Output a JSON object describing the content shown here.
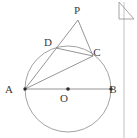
{
  "figure": {
    "background_color": "#ffffff",
    "stroke_color": "#7a7a7a",
    "label_color": "#3c3c3c",
    "points": [
      {
        "id": "P",
        "label": "P",
        "x": 78,
        "y": 20,
        "label_x": 77,
        "label_y": 14,
        "dot": false
      },
      {
        "id": "D",
        "label": "D",
        "x": 56,
        "y": 48,
        "label_x": 48,
        "label_y": 46,
        "dot": false
      },
      {
        "id": "C",
        "label": "C",
        "x": 93,
        "y": 56,
        "label_x": 97,
        "label_y": 56,
        "dot": false
      },
      {
        "id": "A",
        "label": "A",
        "x": 25,
        "y": 89,
        "label_x": 9,
        "label_y": 93,
        "dot": true
      },
      {
        "id": "B",
        "label": "B",
        "x": 111,
        "y": 89,
        "label_x": 113,
        "label_y": 93,
        "dot": true
      },
      {
        "id": "O",
        "label": "O",
        "x": 68,
        "y": 89,
        "label_x": 64,
        "label_y": 102,
        "dot": true
      }
    ],
    "circle": {
      "cx": 68,
      "cy": 89,
      "r": 43
    },
    "segments": [
      {
        "name": "segment-AB",
        "from": "A",
        "to": "B"
      },
      {
        "name": "segment-AD",
        "from": "A",
        "to": "D"
      },
      {
        "name": "segment-AC",
        "from": "A",
        "to": "C"
      },
      {
        "name": "segment-DC",
        "from": "D",
        "to": "C"
      },
      {
        "name": "segment-PD",
        "from": "P",
        "to": "D"
      },
      {
        "name": "segment-PC",
        "from": "P",
        "to": "C"
      },
      {
        "name": "segment-PD-extended",
        "from": "P",
        "to": "A"
      }
    ]
  },
  "page_corner": {
    "icon": "page-fold-icon",
    "x": 119,
    "y": 2,
    "width": 15,
    "height": 17
  },
  "right_rule": {
    "x": 124,
    "y_top": 2,
    "y_bottom": 138
  }
}
